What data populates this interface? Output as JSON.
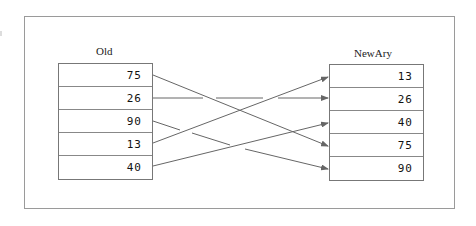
{
  "diagram": {
    "old_array": {
      "label": "Old",
      "values": [
        "75",
        "26",
        "90",
        "13",
        "40"
      ]
    },
    "new_array": {
      "label": "NewAry",
      "values": [
        "13",
        "26",
        "40",
        "75",
        "90"
      ]
    },
    "mappings": [
      {
        "from_value": "75",
        "from_index": 0,
        "to_index": 3
      },
      {
        "from_value": "26",
        "from_index": 1,
        "to_index": 1
      },
      {
        "from_value": "90",
        "from_index": 2,
        "to_index": 4
      },
      {
        "from_value": "13",
        "from_index": 3,
        "to_index": 0
      },
      {
        "from_value": "40",
        "from_index": 4,
        "to_index": 2
      }
    ],
    "colors": {
      "arrow": "#666666",
      "border": "#888888",
      "frame": "#9a9a9a"
    }
  }
}
